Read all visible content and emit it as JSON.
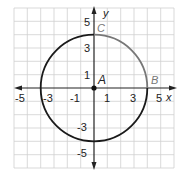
{
  "figure": {
    "type": "coordinate-plane-circle",
    "x_axis_label": "x",
    "y_axis_label": "y",
    "x_tick_labels": [
      "-5",
      "-3",
      "-1",
      "1",
      "3",
      "5"
    ],
    "y_tick_labels": [
      "5",
      "3",
      "1",
      "-3",
      "-5"
    ],
    "points": [
      {
        "label": "A",
        "x": 0,
        "y": 0
      },
      {
        "label": "B",
        "x": 4,
        "y": 0
      },
      {
        "label": "C",
        "x": 0,
        "y": 4
      }
    ],
    "circle": {
      "center": "A",
      "radius": 4
    },
    "colors": {
      "grid": "#c8c8c8",
      "axis": "#222222",
      "circle": "#1a1a1a",
      "arc_highlight": "#777777",
      "label_gray": "#777777"
    }
  }
}
